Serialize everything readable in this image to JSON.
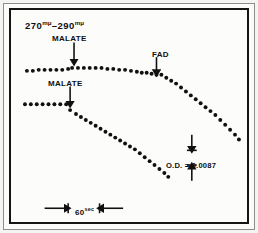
{
  "figure": {
    "wavelength_label": "270",
    "wavelength_label_unit": "mμ",
    "wavelength_label_2": "290",
    "wavelength_label_unit_2": "mμ",
    "wavelength_full": "270 mμ – 290 mμ",
    "od_label": "O.D. = 0.0087",
    "timebar_value": "60",
    "timebar_unit": "sec",
    "annotations": [
      {
        "name": "malate-upper",
        "label": "MALATE"
      },
      {
        "name": "malate-lower",
        "label": "MALATE"
      },
      {
        "name": "fad",
        "label": "FAD"
      }
    ],
    "colors": {
      "trace": "#101010",
      "frame": "#151515",
      "outer_rule": "#8d8d8d",
      "background": "#fcfcfb",
      "text": "#101010"
    }
  },
  "chart_data": {
    "type": "scatter",
    "title": "",
    "subtitle": "",
    "xlabel": "time",
    "ylabel": "optical density (270 mμ – 290 mμ)",
    "grid": false,
    "legend": "none",
    "axis_note": "No numeric axes drawn; scale given by 60 sec horizontal bar and O.D. = 0.0087 vertical bar",
    "xlim": [
      0,
      240
    ],
    "ylim": [
      216,
      0
    ],
    "scale_bars": [
      {
        "name": "time-scale-bar",
        "label": "60",
        "unit": "sec",
        "orientation": "horizontal",
        "x1": 34,
        "x2": 114,
        "y": 202
      },
      {
        "name": "od-scale-bar",
        "label": "O.D. = 0.0087",
        "orientation": "vertical",
        "x": 184,
        "y1": 127,
        "y2": 174
      }
    ],
    "event_markers": [
      {
        "name": "malate-upper-arrow",
        "label": "MALATE",
        "x": 64,
        "y_text": 25,
        "arrow_from_y": 33,
        "arrow_to_y": 53
      },
      {
        "name": "malate-lower-arrow",
        "label": "MALATE",
        "x": 60,
        "y_text": 70,
        "arrow_from_y": 78,
        "arrow_to_y": 96
      },
      {
        "name": "fad-arrow",
        "label": "FAD",
        "x": 148,
        "y_text": 41,
        "arrow_from_y": 48,
        "arrow_to_y": 64
      }
    ],
    "series": [
      {
        "name": "upper-trace-baseline",
        "description": "Pre-malate baseline, upper trace",
        "points": [
          [
            16,
            62
          ],
          [
            22,
            62
          ],
          [
            28,
            61
          ],
          [
            34,
            61
          ],
          [
            40,
            61
          ],
          [
            46,
            61
          ],
          [
            52,
            61
          ],
          [
            58,
            60
          ]
        ]
      },
      {
        "name": "upper-trace-post-malate",
        "description": "Upper trace after malate addition: slow decline to FAD",
        "points": [
          [
            62,
            59
          ],
          [
            68,
            59
          ],
          [
            74,
            59
          ],
          [
            80,
            59
          ],
          [
            86,
            59
          ],
          [
            92,
            59
          ],
          [
            98,
            60
          ],
          [
            104,
            60
          ],
          [
            110,
            61
          ],
          [
            116,
            61
          ],
          [
            122,
            62
          ],
          [
            128,
            63
          ],
          [
            133,
            64
          ],
          [
            138,
            64
          ],
          [
            143,
            65
          ],
          [
            148,
            66
          ]
        ]
      },
      {
        "name": "upper-trace-post-fad",
        "description": "Upper trace after FAD addition: steep linear decline",
        "points": [
          [
            153,
            66
          ],
          [
            158,
            69
          ],
          [
            163,
            72
          ],
          [
            168,
            75
          ],
          [
            173,
            79
          ],
          [
            178,
            83
          ],
          [
            183,
            87
          ],
          [
            188,
            91
          ],
          [
            193,
            95
          ],
          [
            198,
            99
          ],
          [
            203,
            103
          ],
          [
            208,
            107
          ],
          [
            213,
            112
          ],
          [
            218,
            117
          ],
          [
            223,
            122
          ],
          [
            228,
            127
          ],
          [
            232,
            132
          ]
        ]
      },
      {
        "name": "lower-trace-baseline",
        "description": "Pre-malate baseline, lower trace",
        "points": [
          [
            14,
            96
          ],
          [
            20,
            96
          ],
          [
            26,
            96
          ],
          [
            32,
            96
          ],
          [
            38,
            96
          ],
          [
            44,
            96
          ],
          [
            50,
            96
          ],
          [
            56,
            96
          ]
        ]
      },
      {
        "name": "lower-trace-post-malate",
        "description": "Lower trace after malate addition: steep continuous decline",
        "points": [
          [
            60,
            102
          ],
          [
            66,
            106
          ],
          [
            71,
            109
          ],
          [
            76,
            112
          ],
          [
            81,
            115
          ],
          [
            86,
            118
          ],
          [
            91,
            121
          ],
          [
            96,
            124
          ],
          [
            101,
            127
          ],
          [
            106,
            130
          ],
          [
            111,
            133
          ],
          [
            116,
            136
          ],
          [
            121,
            139
          ],
          [
            126,
            142
          ],
          [
            131,
            146
          ],
          [
            136,
            150
          ],
          [
            141,
            154
          ],
          [
            146,
            158
          ],
          [
            151,
            162
          ],
          [
            156,
            166
          ],
          [
            160,
            170
          ]
        ]
      }
    ]
  }
}
